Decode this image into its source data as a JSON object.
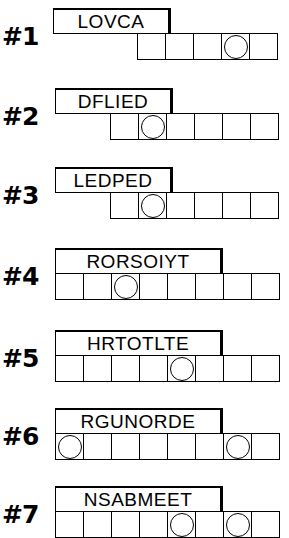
{
  "puzzle": {
    "type": "word-jumble",
    "rows": [
      {
        "number": "#1",
        "scrambled_word": "LOVCA",
        "answer_cells": 5,
        "circled_positions": [
          4
        ],
        "word_box": {
          "left": 53,
          "top": 8,
          "width": 118,
          "height": 26
        },
        "grid": {
          "left": 137,
          "top": 33,
          "cell_width": 28,
          "height": 27
        },
        "number_pos": {
          "left": 2,
          "top": 24
        }
      },
      {
        "number": "#2",
        "scrambled_word": "DFLIED",
        "answer_cells": 6,
        "circled_positions": [
          2
        ],
        "word_box": {
          "left": 55,
          "top": 88,
          "width": 118,
          "height": 26
        },
        "grid": {
          "left": 110,
          "top": 113,
          "cell_width": 28,
          "height": 27
        },
        "number_pos": {
          "left": 2,
          "top": 104
        }
      },
      {
        "number": "#3",
        "scrambled_word": "LEDPED",
        "answer_cells": 6,
        "circled_positions": [
          2
        ],
        "word_box": {
          "left": 55,
          "top": 167,
          "width": 118,
          "height": 26
        },
        "grid": {
          "left": 110,
          "top": 192,
          "cell_width": 28,
          "height": 27
        },
        "number_pos": {
          "left": 2,
          "top": 183
        }
      },
      {
        "number": "#4",
        "scrambled_word": "RORSOIYT",
        "answer_cells": 8,
        "circled_positions": [
          3
        ],
        "word_box": {
          "left": 55,
          "top": 248,
          "width": 168,
          "height": 26
        },
        "grid": {
          "left": 55,
          "top": 273,
          "cell_width": 28,
          "height": 27
        },
        "number_pos": {
          "left": 2,
          "top": 264
        }
      },
      {
        "number": "#5",
        "scrambled_word": "HRTOTLTE",
        "answer_cells": 8,
        "circled_positions": [
          5
        ],
        "word_box": {
          "left": 55,
          "top": 330,
          "width": 168,
          "height": 26
        },
        "grid": {
          "left": 55,
          "top": 355,
          "cell_width": 28,
          "height": 27
        },
        "number_pos": {
          "left": 2,
          "top": 346
        }
      },
      {
        "number": "#6",
        "scrambled_word": "RGUNORDE",
        "answer_cells": 8,
        "circled_positions": [
          1,
          7
        ],
        "word_box": {
          "left": 55,
          "top": 408,
          "width": 168,
          "height": 26
        },
        "grid": {
          "left": 55,
          "top": 433,
          "cell_width": 28,
          "height": 27
        },
        "number_pos": {
          "left": 2,
          "top": 424
        }
      },
      {
        "number": "#7",
        "scrambled_word": "NSABMEET",
        "answer_cells": 8,
        "circled_positions": [
          5,
          7
        ],
        "word_box": {
          "left": 55,
          "top": 486,
          "width": 168,
          "height": 26
        },
        "grid": {
          "left": 55,
          "top": 511,
          "cell_width": 28,
          "height": 27
        },
        "number_pos": {
          "left": 2,
          "top": 502
        }
      }
    ]
  },
  "colors": {
    "ink": "#000000",
    "paper": "#ffffff"
  }
}
